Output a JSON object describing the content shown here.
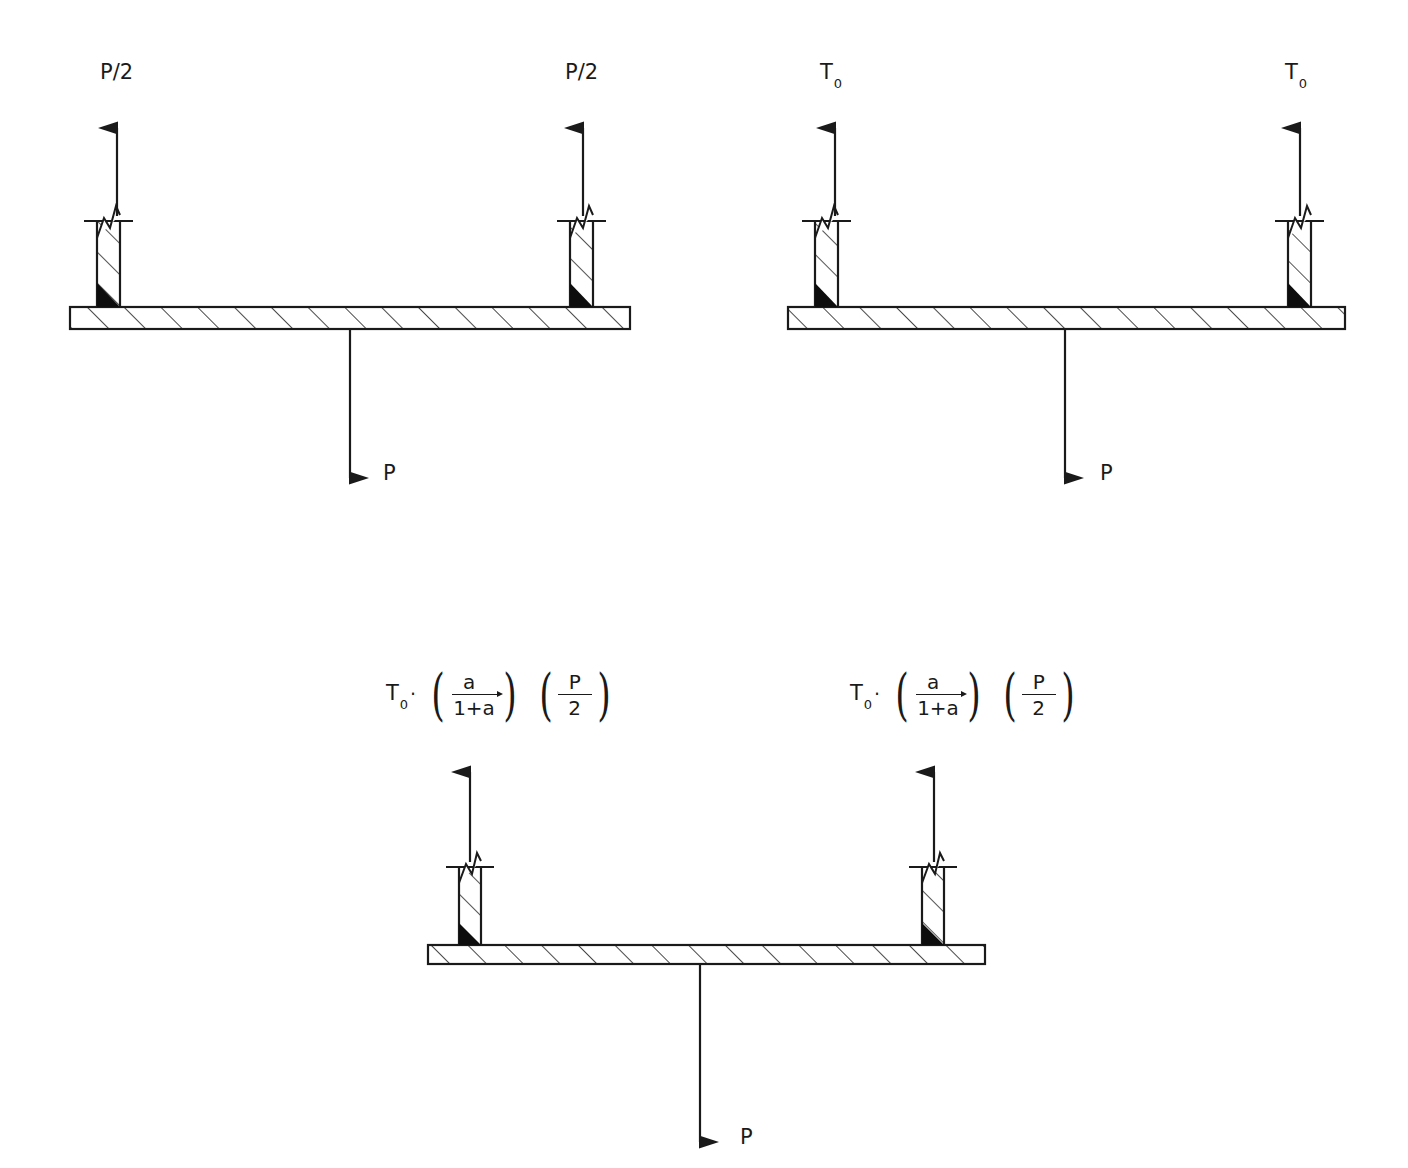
{
  "figure": {
    "type": "free-body-diagram-set",
    "background": "#ffffff",
    "stroke_color": "#1a1a1a",
    "diagram_count": 3
  },
  "diagrams": [
    {
      "id": "diagram-top-left",
      "name": "symmetric-load-P-over-2",
      "beam": {
        "x": 70,
        "y": 307,
        "width": 560,
        "height": 22
      },
      "supports": [
        {
          "side": "left",
          "x": 97,
          "y": 212,
          "width": 23,
          "height": 95,
          "weld": "bottom-left"
        },
        {
          "side": "right",
          "x": 570,
          "y": 212,
          "width": 23,
          "height": 95,
          "weld": "bottom-left"
        }
      ],
      "reactions": [
        {
          "label": "P/2",
          "direction": "up",
          "x": 117,
          "label_x": 100,
          "label_y": 62
        },
        {
          "label": "P/2",
          "direction": "up",
          "x": 583,
          "label_x": 565,
          "label_y": 62
        }
      ],
      "load": {
        "label": "P",
        "direction": "down",
        "x": 350,
        "label_x": 383,
        "label_y": 463
      }
    },
    {
      "id": "diagram-top-right",
      "name": "pretension-T0",
      "beam": {
        "x": 788,
        "y": 307,
        "width": 557,
        "height": 22
      },
      "supports": [
        {
          "side": "left",
          "x": 815,
          "y": 212,
          "width": 23,
          "height": 95,
          "weld": "bottom-left"
        },
        {
          "side": "right",
          "x": 1288,
          "y": 212,
          "width": 23,
          "height": 95,
          "weld": "bottom-left"
        }
      ],
      "reactions": [
        {
          "label": "T",
          "sub": "0",
          "direction": "up",
          "x": 835,
          "label_x": 820,
          "label_y": 62
        },
        {
          "label": "T",
          "sub": "0",
          "direction": "up",
          "x": 1300,
          "label_x": 1285,
          "label_y": 62
        }
      ],
      "load": {
        "label": "P",
        "direction": "down",
        "x": 1065,
        "label_x": 1100,
        "label_y": 463
      }
    },
    {
      "id": "diagram-bottom",
      "name": "combined-T0-plus-stiffness-ratio-load",
      "beam": {
        "x": 428,
        "y": 945,
        "width": 557,
        "height": 19
      },
      "supports": [
        {
          "side": "left",
          "x": 459,
          "y": 858,
          "width": 22,
          "height": 87,
          "weld": "bottom-left"
        },
        {
          "side": "right",
          "x": 922,
          "y": 858,
          "width": 22,
          "height": 87,
          "weld": "bottom-left"
        }
      ],
      "reactions": [
        {
          "direction": "up",
          "x": 470,
          "formula": "formula-left"
        },
        {
          "direction": "up",
          "x": 934,
          "formula": "formula-right"
        }
      ],
      "load": {
        "label": "P",
        "direction": "down",
        "x": 700,
        "label_x": 740,
        "label_y": 1127
      }
    }
  ],
  "formulas": {
    "left": {
      "x": 386,
      "y": 672,
      "base": "T",
      "base_sub": "0",
      "operator": "·",
      "terms": [
        {
          "numerator": "a",
          "denominator": "1+a",
          "bar_arrow": true
        },
        {
          "numerator": "P",
          "denominator": "2",
          "bar_arrow": false
        }
      ]
    },
    "right": {
      "x": 850,
      "y": 672,
      "base": "T",
      "base_sub": "0",
      "operator": "·",
      "terms": [
        {
          "numerator": "a",
          "denominator": "1+a",
          "bar_arrow": true
        },
        {
          "numerator": "P",
          "denominator": "2",
          "bar_arrow": false
        }
      ]
    }
  },
  "labels": {
    "p_half": "P/2",
    "t_zero_base": "T",
    "t_zero_sub": "0",
    "p_load": "P",
    "frac_a_num": "a",
    "frac_a_den": "1+a",
    "frac_p_num": "P",
    "frac_p_den": "2",
    "dot_operator": "·",
    "paren_open": "(",
    "paren_close": ")"
  }
}
